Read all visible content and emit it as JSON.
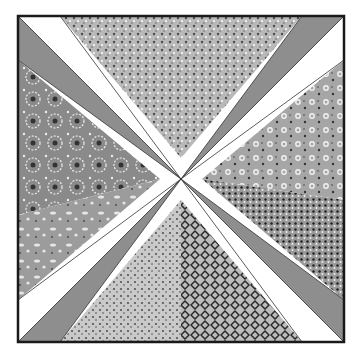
{
  "block": {
    "x": 18,
    "y": 16,
    "size": 326,
    "border_color": "#1a1a1a",
    "strip_gray": "#8e8e8e",
    "strip_white": "#ffffff"
  },
  "fabrics": {
    "top": {
      "name": "light-speckled-print",
      "base": "#b9b9b9",
      "dot": "#4a4a4a"
    },
    "right_upper": {
      "name": "small-flower-print",
      "base": "#a6a6a6",
      "dot": "#f2f2f2"
    },
    "right_lower": {
      "name": "dark-speckled-print",
      "base": "#9a9a9a",
      "dot": "#1e1e1e"
    },
    "bottom_left": {
      "name": "light-dotted-print",
      "base": "#c9c9c9",
      "dot": "#555555"
    },
    "bottom_right": {
      "name": "dark-lace-print",
      "base": "#bdbdbd",
      "dot": "#2a2a2a"
    },
    "left_upper": {
      "name": "daisy-flower-print",
      "base": "#8a8a8a",
      "dot": "#eeeeee"
    },
    "left_lower": {
      "name": "medium-gray-leaf-print",
      "base": "#9c9c9c",
      "dot": "#e6e6e6"
    }
  }
}
